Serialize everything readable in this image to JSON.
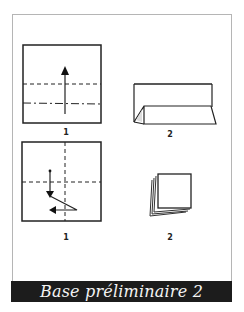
{
  "diagram": {
    "title": "Base préliminaire 2",
    "rows": [
      {
        "steps": [
          {
            "label": "1",
            "description": "Square with dashed fold line and dash-dot fold line, upward arrow"
          },
          {
            "label": "2",
            "description": "Folded paper with tent-like pleat at bottom"
          }
        ]
      },
      {
        "steps": [
          {
            "label": "1",
            "description": "Square with vertical and horizontal dashed fold lines, zig-zag arrow down then left"
          },
          {
            "label": "2",
            "description": "Layered folded square (preliminary base)"
          }
        ]
      }
    ]
  },
  "colors": {
    "title_bar_bg": "#1c1c1c",
    "title_text": "#f3f3f3",
    "line": "#222222",
    "frame": "#b5b5b5"
  }
}
